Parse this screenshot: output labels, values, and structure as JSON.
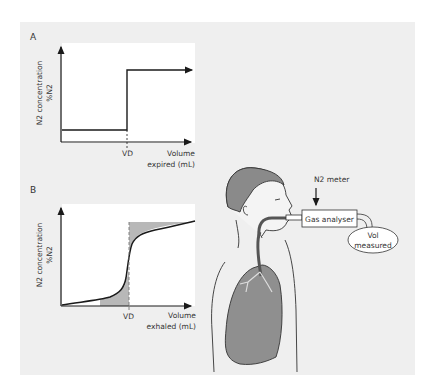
{
  "figure": {
    "panel_a": {
      "label": "A",
      "y_axis_label_line1": "N2 concentration",
      "y_axis_label_line2": "%N2",
      "x_marker": "VD",
      "x_axis_label_line1": "Volume",
      "x_axis_label_line2": "expired (mL)"
    },
    "panel_b": {
      "label": "B",
      "y_axis_label_line1": "N2 concentration",
      "y_axis_label_line2": "%N2",
      "x_marker": "VD",
      "x_axis_label_line1": "Volume",
      "x_axis_label_line2": "exhaled (mL)"
    },
    "apparatus": {
      "meter_label": "N2 meter",
      "analyser_label": "Gas analyser",
      "volume_label_line1": "Vol",
      "volume_label_line2": "measured"
    },
    "colors": {
      "panel_bg": "#efefef",
      "plot_bg": "#ffffff",
      "shading": "#b8b8b8",
      "lung": "#8f8f8f",
      "hair": "#8a8a8a",
      "line": "#1a1a1a"
    }
  }
}
